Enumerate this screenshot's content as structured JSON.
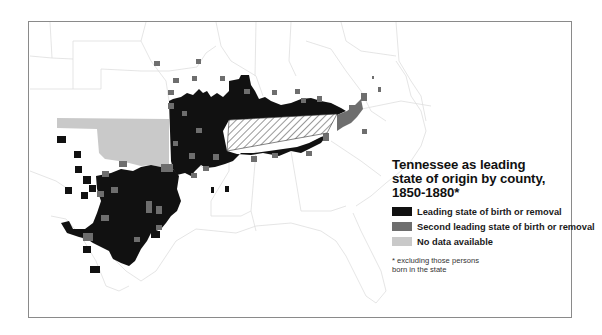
{
  "map": {
    "title_lines": [
      "Tennessee as leading",
      "state of origin by county,",
      "1850-1880*"
    ],
    "subject_state": "Tennessee",
    "subject_state_pattern": "diagonal-hatch",
    "region_shown": "South-central and southeastern United States",
    "legend": {
      "items": [
        {
          "label": "Leading state of birth or removal",
          "color": "#111111"
        },
        {
          "label": "Second leading state of birth or removal",
          "color": "#6e6e6e"
        },
        {
          "label": "No data available",
          "color": "#c9c9c9"
        }
      ]
    },
    "footnote_lines": [
      "* excluding those persons",
      "born in the state"
    ],
    "colors": {
      "leading": "#111111",
      "second": "#6e6e6e",
      "no_data": "#c9c9c9",
      "state_borders": "#dcdcdc",
      "frame": "#8a8a8a"
    }
  }
}
